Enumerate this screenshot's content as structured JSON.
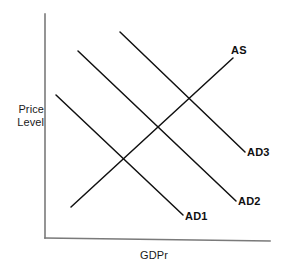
{
  "figure": {
    "width": 285,
    "height": 273,
    "background": "#ffffff"
  },
  "axes": {
    "y_label_line1": "Price",
    "y_label_line2": "Level",
    "y_label": "Price Level",
    "x_label": "GDPr",
    "axis_color": "#7a7a7a",
    "y_axis": {
      "x": 45,
      "y_top": 14,
      "y_bottom": 238
    },
    "x_axis": {
      "y_left": 238,
      "y_right": 241,
      "x_left": 45,
      "x_right": 270
    }
  },
  "chart_data": {
    "type": "line",
    "title": "",
    "subtitle": "",
    "xlabel": "GDPr",
    "ylabel": "Price Level",
    "grid": false,
    "legend": "inline-end-labels",
    "axis_ticks": [],
    "xlim": [
      45,
      270
    ],
    "ylim": [
      238,
      14
    ],
    "note": "Aggregate supply and three aggregate demand curves; coordinates are in screen pixels (y increases downward).",
    "series": [
      {
        "name": "AS",
        "label": "AS",
        "direction": "upward-sloping",
        "color": "#101010",
        "x": [
          71,
          233
        ],
        "y": [
          207,
          58
        ],
        "label_at": {
          "x": 231,
          "y": 44
        }
      },
      {
        "name": "AD1",
        "label": "AD1",
        "direction": "downward-sloping",
        "color": "#101010",
        "x": [
          56,
          183
        ],
        "y": [
          95,
          215
        ],
        "label_at": {
          "x": 185,
          "y": 210
        }
      },
      {
        "name": "AD2",
        "label": "AD2",
        "direction": "downward-sloping",
        "color": "#101010",
        "x": [
          78,
          236
        ],
        "y": [
          51,
          201
        ],
        "label_at": {
          "x": 238,
          "y": 195
        }
      },
      {
        "name": "AD3",
        "label": "AD3",
        "direction": "downward-sloping",
        "color": "#101010",
        "x": [
          120,
          245
        ],
        "y": [
          32,
          152
        ],
        "label_at": {
          "x": 247,
          "y": 146
        }
      }
    ],
    "intersections": [
      {
        "name": "AS x AD1",
        "x": 122,
        "y": 163
      },
      {
        "name": "AS x AD2",
        "x": 152,
        "y": 132
      },
      {
        "name": "AS x AD3",
        "x": 190,
        "y": 100
      }
    ]
  }
}
